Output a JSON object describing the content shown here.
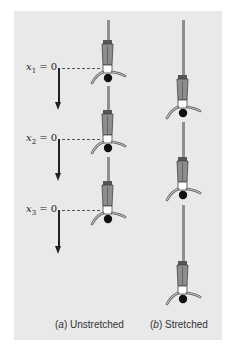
{
  "figure": {
    "panel_color": "#e9e9e9",
    "rope_color": "#8f8f8f",
    "columns": [
      {
        "id": "a",
        "caption_letter": "a",
        "caption_text": "Unstretched",
        "positions": [
          {
            "var": "x",
            "sub": "1",
            "eq": " = 0"
          },
          {
            "var": "x",
            "sub": "2",
            "eq": " = 0"
          },
          {
            "var": "x",
            "sub": "3",
            "eq": " = 0"
          }
        ]
      },
      {
        "id": "b",
        "caption_letter": "b",
        "caption_text": "Stretched"
      }
    ],
    "icons": {
      "jumper": "bungee-jumper-upside-down-icon",
      "arrow": "down-arrow-icon"
    }
  }
}
